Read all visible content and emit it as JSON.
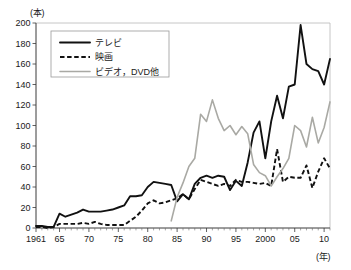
{
  "chart_data": {
    "type": "line",
    "title": "",
    "xlabel": "(年)",
    "ylabel": "(本)",
    "xlim": [
      1961,
      2011
    ],
    "ylim": [
      0,
      200
    ],
    "grid": false,
    "legend_position": "top-left",
    "y_ticks": [
      0,
      20,
      40,
      60,
      80,
      100,
      120,
      140,
      160,
      180,
      200
    ],
    "y_tick_labels": [
      "0",
      "20",
      "40",
      "60",
      "80",
      "100",
      "120",
      "140",
      "160",
      "180",
      "200"
    ],
    "x_ticks": [
      1961,
      1965,
      1970,
      1975,
      1980,
      1985,
      1990,
      1995,
      2000,
      2005,
      2010
    ],
    "x_tick_labels": [
      "1961",
      "65",
      "70",
      "75",
      "80",
      "85",
      "90",
      "95",
      "2000",
      "05",
      "10"
    ],
    "x": [
      1961,
      1962,
      1963,
      1964,
      1965,
      1966,
      1967,
      1968,
      1969,
      1970,
      1971,
      1972,
      1973,
      1974,
      1975,
      1976,
      1977,
      1978,
      1979,
      1980,
      1981,
      1982,
      1983,
      1984,
      1985,
      1986,
      1987,
      1988,
      1989,
      1990,
      1991,
      1992,
      1993,
      1994,
      1995,
      1996,
      1997,
      1998,
      1999,
      2000,
      2001,
      2002,
      2003,
      2004,
      2005,
      2006,
      2007,
      2008,
      2009,
      2010,
      2011
    ],
    "series": [
      {
        "name": "テレビ",
        "style": "solid",
        "color": "#111111",
        "values": [
          2,
          2,
          1,
          1,
          14,
          11,
          13,
          15,
          18,
          16,
          16,
          16,
          17,
          18,
          20,
          22,
          31,
          31,
          32,
          40,
          45,
          44,
          43,
          42,
          26,
          33,
          28,
          43,
          49,
          51,
          49,
          51,
          50,
          37,
          46,
          41,
          64,
          93,
          104,
          68,
          104,
          129,
          107,
          138,
          140,
          198,
          160,
          155,
          153,
          140,
          165
        ]
      },
      {
        "name": "映画",
        "style": "dashed",
        "color": "#111111",
        "values": [
          1,
          1,
          0,
          1,
          4,
          4,
          4,
          4,
          5,
          4,
          6,
          4,
          3,
          3,
          3,
          3,
          7,
          11,
          17,
          24,
          27,
          24,
          25,
          27,
          29,
          33,
          28,
          38,
          47,
          45,
          43,
          41,
          43,
          41,
          47,
          45,
          45,
          44,
          43,
          44,
          41,
          77,
          45,
          50,
          49,
          49,
          61,
          39,
          55,
          68,
          58
        ]
      },
      {
        "name": "ビデオ，DVD他",
        "style": "solid-gray",
        "color": "#a9a9a4",
        "values": [
          null,
          null,
          null,
          null,
          null,
          null,
          null,
          null,
          null,
          null,
          null,
          null,
          null,
          null,
          null,
          null,
          null,
          null,
          null,
          null,
          null,
          null,
          null,
          7,
          30,
          44,
          60,
          68,
          111,
          104,
          125,
          107,
          95,
          100,
          91,
          99,
          92,
          62,
          54,
          51,
          41,
          50,
          58,
          68,
          100,
          95,
          79,
          108,
          83,
          98,
          123
        ]
      }
    ],
    "legend": [
      {
        "label": "テレビ",
        "style": "solid",
        "color": "#111111"
      },
      {
        "label": "映画",
        "style": "dashed",
        "color": "#111111"
      },
      {
        "label": "ビデオ，DVD他",
        "style": "solid-gray",
        "color": "#a9a9a4"
      }
    ]
  }
}
